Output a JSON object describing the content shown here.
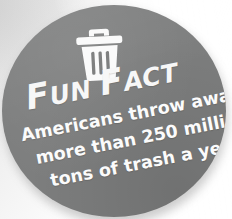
{
  "badge": {
    "shape": "circle",
    "background_color": "#7d7e7e",
    "text_color": "#fbfbfb",
    "page_background_color": "#f2f2f2",
    "icon": {
      "name": "trash-can-icon",
      "label": "trash can"
    },
    "heading": {
      "full_text": "FUN FACT",
      "word_one_initial": "F",
      "word_one_rest": "UN",
      "word_two_initial": "F",
      "word_two_rest": "ACT"
    },
    "body": {
      "full_text": "Americans throw away more than 250 million tons of trash a year.",
      "lines": [
        "Americans throw away",
        "more than 250 million",
        "tons of trash a year."
      ]
    }
  }
}
